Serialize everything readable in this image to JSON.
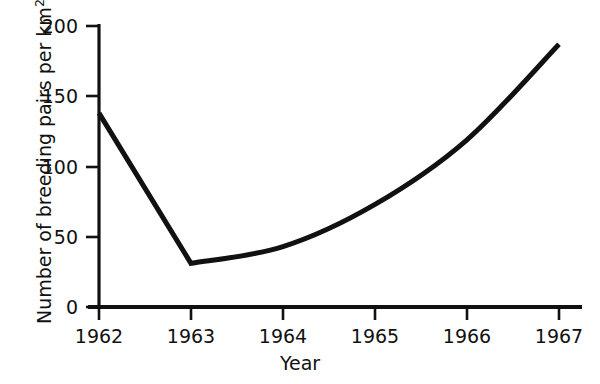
{
  "chart_data": {
    "type": "line",
    "title": "",
    "xlabel": "Year",
    "ylabel_text": "Number of breeding pairs per km",
    "ylabel_superscript": "2",
    "ylabel_full": "Number of breeding pairs per km2",
    "x": [
      1962,
      1963,
      1964,
      1965,
      1966,
      1967
    ],
    "values": [
      138,
      31,
      43,
      73,
      119,
      187
    ],
    "series": [
      {
        "name": "Breeding pairs per km2",
        "values": [
          138,
          31,
          43,
          73,
          119,
          187
        ]
      }
    ],
    "xtick_labels": [
      "1962",
      "1963",
      "1964",
      "1965",
      "1966",
      "1967"
    ],
    "ytick_labels": [
      "0",
      "50",
      "100",
      "150",
      "200"
    ],
    "ytick_values": [
      0,
      50,
      100,
      150,
      200
    ],
    "xlim": [
      1962,
      1967
    ],
    "ylim": [
      0,
      200
    ],
    "grid": false,
    "legend": false,
    "legend_position": "none",
    "line_color": "#111111",
    "line_width": 5,
    "background_color": "#ffffff",
    "axis_color": "#111111",
    "annotations": []
  }
}
